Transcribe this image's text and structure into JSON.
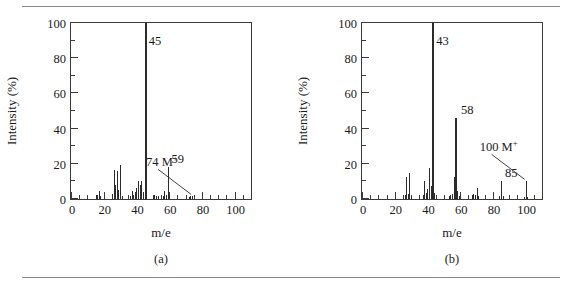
{
  "figure": {
    "panels": [
      {
        "id": "a",
        "panel_label": "(a)",
        "xlabel": "m/e",
        "ylabel": "Intensity (%)"
      },
      {
        "id": "b",
        "panel_label": "(b)",
        "xlabel": "m/e",
        "ylabel": "Intensity (%)"
      }
    ]
  },
  "axis": {
    "y_ticks": [
      "0",
      "20",
      "40",
      "60",
      "80",
      "100"
    ],
    "x_ticks": [
      "0",
      "20",
      "40",
      "60",
      "80",
      "100"
    ]
  },
  "chart_data": [
    {
      "type": "bar",
      "id": "a",
      "title": "(a)",
      "xlabel": "m/e",
      "ylabel": "Intensity (%)",
      "xlim": [
        0,
        110
      ],
      "ylim": [
        0,
        100
      ],
      "grid": false,
      "legend": false,
      "xticks": [
        0,
        20,
        40,
        60,
        80,
        100
      ],
      "xticks_minor_step": 5,
      "yticks": [
        0,
        20,
        40,
        60,
        80,
        100
      ],
      "yticks_minor_step": 10,
      "x": [
        15,
        16,
        17,
        18,
        25,
        26,
        27,
        28,
        29,
        30,
        31,
        36,
        37,
        38,
        39,
        40,
        41,
        42,
        43,
        44,
        45,
        46,
        50,
        51,
        52,
        53,
        56,
        57,
        58,
        59,
        60,
        72,
        73,
        74
      ],
      "values": [
        1.5,
        2.0,
        4.5,
        1.5,
        3.0,
        16.5,
        8.0,
        16.0,
        5.0,
        19.5,
        1.5,
        1.5,
        4.5,
        2.5,
        4.0,
        6.0,
        10.0,
        8.0,
        10.5,
        4.0,
        100.0,
        2.5,
        1.5,
        2.0,
        1.5,
        1.5,
        1.5,
        4.5,
        2.5,
        18.0,
        2.0,
        1.0,
        1.5,
        1.5
      ],
      "annotations": [
        {
          "text": "45",
          "mz": 45,
          "intensity": 100.0,
          "kind": "base-peak"
        },
        {
          "text": "59",
          "mz": 59,
          "intensity": 18.0,
          "kind": "peak"
        },
        {
          "text": "74 M+",
          "mz": 74,
          "intensity": 1.5,
          "kind": "molecular-ion",
          "leader": true
        }
      ]
    },
    {
      "type": "bar",
      "id": "b",
      "title": "(b)",
      "xlabel": "m/e",
      "ylabel": "Intensity (%)",
      "xlim": [
        0,
        110
      ],
      "ylim": [
        0,
        100
      ],
      "grid": false,
      "legend": false,
      "xticks": [
        0,
        20,
        40,
        60,
        80,
        100
      ],
      "xticks_minor_step": 5,
      "yticks": [
        0,
        20,
        40,
        60,
        80,
        100
      ],
      "yticks_minor_step": 10,
      "x": [
        26,
        27,
        28,
        29,
        30,
        37,
        38,
        39,
        40,
        41,
        42,
        43,
        44,
        53,
        54,
        55,
        56,
        57,
        58,
        59,
        67,
        68,
        69,
        70,
        71,
        84,
        85,
        86,
        99,
        100,
        101
      ],
      "values": [
        2.5,
        12.5,
        3.0,
        14.5,
        1.5,
        2.0,
        10.5,
        3.5,
        5.5,
        17.5,
        7.5,
        100.0,
        3.5,
        1.5,
        2.0,
        3.0,
        12.5,
        46.0,
        4.5,
        1.5,
        2.0,
        3.0,
        2.5,
        6.5,
        1.5,
        1.5,
        10.0,
        1.5,
        1.0,
        10.0,
        1.0
      ],
      "annotations": [
        {
          "text": "43",
          "mz": 43,
          "intensity": 100.0,
          "kind": "base-peak"
        },
        {
          "text": "58",
          "mz": 58,
          "intensity": 46.0,
          "kind": "peak"
        },
        {
          "text": "85",
          "mz": 85,
          "intensity": 10.0,
          "kind": "peak"
        },
        {
          "text": "100 M+",
          "mz": 100,
          "intensity": 10.0,
          "kind": "molecular-ion",
          "leader": true
        }
      ]
    }
  ],
  "labels": {
    "a": {
      "peak_45": "45",
      "peak_59": "59",
      "peak_74_num": "74 M",
      "peak_74_sup": "+"
    },
    "b": {
      "peak_43": "43",
      "peak_58": "58",
      "peak_85": "85",
      "peak_100_num": "100 M",
      "peak_100_sup": "+"
    }
  },
  "colors": {
    "stick": "#2b2b2b",
    "frame": "#3a3a3a",
    "rule": "#8a8a8a",
    "text": "#1a1a1a"
  }
}
